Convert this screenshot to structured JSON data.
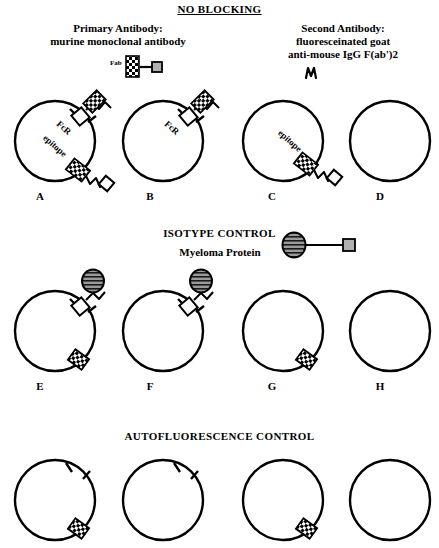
{
  "figure": {
    "sections": [
      {
        "id": "no-blocking",
        "title": "NO BLOCKING"
      },
      {
        "id": "isotype-control",
        "title": "ISOTYPE CONTROL"
      },
      {
        "id": "autofluorescence-control",
        "title": "AUTOFLUORESCENCE CONTROL"
      }
    ],
    "headings": {
      "primary_antibody": "Primary Antibody:\nmurine monoclonal antibody",
      "primary_antibody_line1": "Primary Antibody:",
      "primary_antibody_line2": "murine monoclonal antibody",
      "second_antibody_line1": "Second Antibody:",
      "second_antibody_line2": "fluoresceinated goat",
      "second_antibody_line3": "anti-mouse IgG F(ab')2",
      "myeloma_protein": "Myeloma Protein"
    },
    "legends": {
      "fab_label": "Fab"
    },
    "cell_labels": {
      "fcr": "FcR",
      "epitope": "epitope"
    },
    "panels": [
      {
        "letter": "A",
        "row": 1,
        "has_epitope_label": true,
        "has_fcr_label": true,
        "fcr_bound": true,
        "epitope_bound": true,
        "second_antibody_on_fcr": true,
        "second_antibody_on_epitope": true,
        "myeloma": false,
        "bare_prongs": false
      },
      {
        "letter": "B",
        "row": 1,
        "has_epitope_label": false,
        "has_fcr_label": true,
        "fcr_bound": true,
        "epitope_bound": false,
        "second_antibody_on_fcr": true,
        "second_antibody_on_epitope": false,
        "myeloma": false,
        "bare_prongs": false
      },
      {
        "letter": "C",
        "row": 1,
        "has_epitope_label": true,
        "has_fcr_label": false,
        "fcr_bound": false,
        "epitope_bound": true,
        "second_antibody_on_fcr": false,
        "second_antibody_on_epitope": true,
        "myeloma": false,
        "bare_prongs": false
      },
      {
        "letter": "D",
        "row": 1,
        "has_epitope_label": false,
        "has_fcr_label": false,
        "fcr_bound": false,
        "epitope_bound": false,
        "second_antibody_on_fcr": false,
        "second_antibody_on_epitope": false,
        "myeloma": false,
        "bare_prongs": false
      },
      {
        "letter": "E",
        "row": 2,
        "has_epitope_label": false,
        "has_fcr_label": false,
        "fcr_bound": true,
        "epitope_bound": true,
        "second_antibody_on_fcr": false,
        "second_antibody_on_epitope": false,
        "myeloma": true,
        "bare_prongs": false
      },
      {
        "letter": "F",
        "row": 2,
        "has_epitope_label": false,
        "has_fcr_label": false,
        "fcr_bound": true,
        "epitope_bound": false,
        "second_antibody_on_fcr": false,
        "second_antibody_on_epitope": false,
        "myeloma": true,
        "bare_prongs": false
      },
      {
        "letter": "G",
        "row": 2,
        "has_epitope_label": false,
        "has_fcr_label": false,
        "fcr_bound": false,
        "epitope_bound": true,
        "second_antibody_on_fcr": false,
        "second_antibody_on_epitope": false,
        "myeloma": false,
        "bare_prongs": false
      },
      {
        "letter": "H",
        "row": 2,
        "has_epitope_label": false,
        "has_fcr_label": false,
        "fcr_bound": false,
        "epitope_bound": false,
        "second_antibody_on_fcr": false,
        "second_antibody_on_epitope": false,
        "myeloma": false,
        "bare_prongs": false
      },
      {
        "letter": "",
        "row": 3,
        "has_epitope_label": false,
        "has_fcr_label": false,
        "fcr_bound": false,
        "epitope_bound": true,
        "second_antibody_on_fcr": false,
        "second_antibody_on_epitope": false,
        "myeloma": false,
        "bare_prongs": true
      },
      {
        "letter": "",
        "row": 3,
        "has_epitope_label": false,
        "has_fcr_label": false,
        "fcr_bound": false,
        "epitope_bound": false,
        "second_antibody_on_fcr": false,
        "second_antibody_on_epitope": false,
        "myeloma": false,
        "bare_prongs": true
      },
      {
        "letter": "",
        "row": 3,
        "has_epitope_label": false,
        "has_fcr_label": false,
        "fcr_bound": false,
        "epitope_bound": true,
        "second_antibody_on_fcr": false,
        "second_antibody_on_epitope": false,
        "myeloma": false,
        "bare_prongs": false
      },
      {
        "letter": "",
        "row": 3,
        "has_epitope_label": false,
        "has_fcr_label": false,
        "fcr_bound": false,
        "epitope_bound": false,
        "second_antibody_on_fcr": false,
        "second_antibody_on_epitope": false,
        "myeloma": false,
        "bare_prongs": false
      }
    ],
    "colors": {
      "ink": "#000000",
      "background": "#ffffff",
      "myeloma_fill": "#808080",
      "fab_square_fill": "#b0b0b0"
    }
  }
}
